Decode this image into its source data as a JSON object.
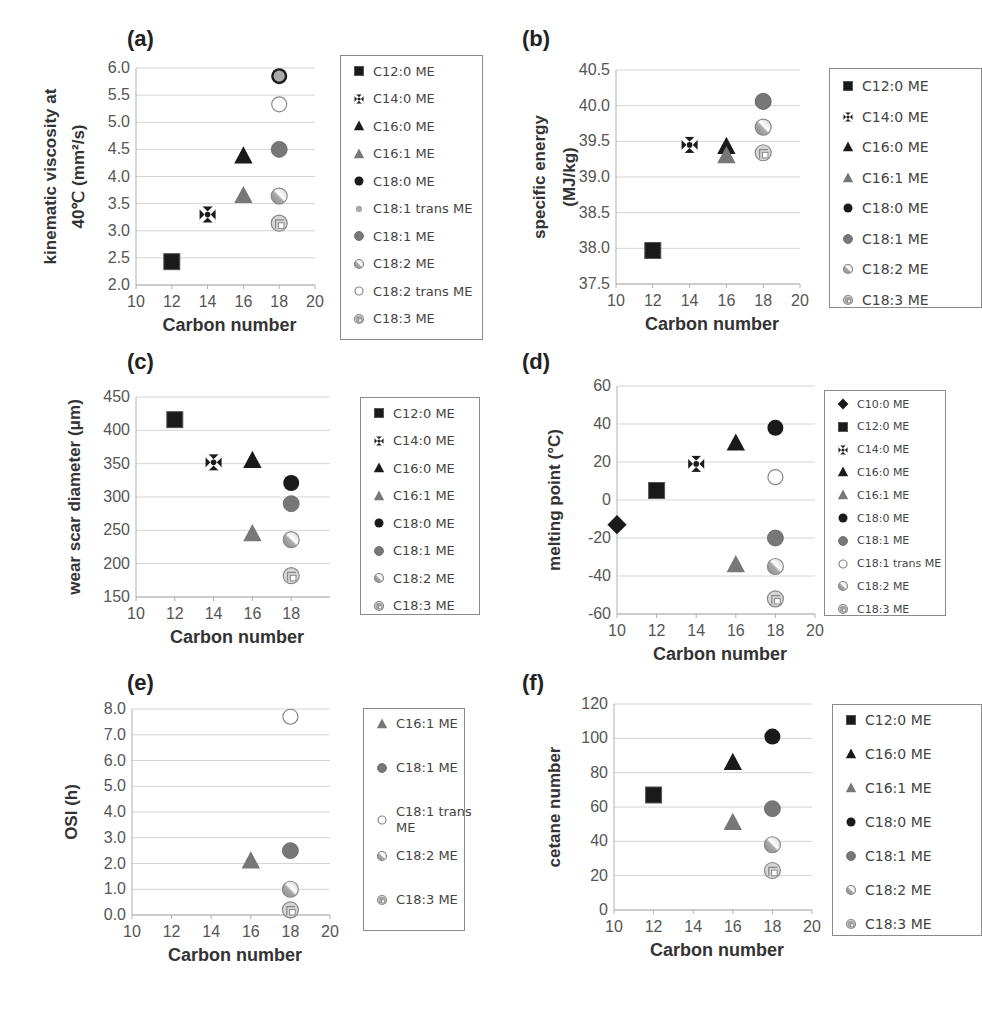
{
  "figure": {
    "panels": [
      {
        "id": "a",
        "label": "(a)"
      },
      {
        "id": "b",
        "label": "(b)"
      },
      {
        "id": "c",
        "label": "(c)"
      },
      {
        "id": "d",
        "label": "(d)"
      },
      {
        "id": "e",
        "label": "(e)"
      },
      {
        "id": "f",
        "label": "(f)"
      }
    ]
  },
  "chart_data": [
    {
      "id": "a",
      "type": "scatter",
      "panel_label": "(a)",
      "title": "",
      "xlabel": "Carbon number",
      "ylabel": "kinematic viscosity at 40°C (mm²/s)",
      "ylabel_lines": [
        "kinematic viscosity at",
        "40℃ (mm²/s)"
      ],
      "xlim": [
        10,
        20
      ],
      "xticks": [
        10,
        12,
        14,
        16,
        18,
        20
      ],
      "ylim": [
        2.0,
        6.0
      ],
      "yticks": [
        "2.0",
        "2.5",
        "3.0",
        "3.5",
        "4.0",
        "4.5",
        "5.0",
        "5.5",
        "6.0"
      ],
      "grid": true,
      "legend_position": "right",
      "series": [
        {
          "name": "C12:0 ME",
          "marker": "square",
          "x": 12,
          "y": 2.43
        },
        {
          "name": "C14:0 ME",
          "marker": "cross-square",
          "x": 14,
          "y": 3.3
        },
        {
          "name": "C16:0 ME",
          "marker": "triangle-dark",
          "x": 16,
          "y": 4.38
        },
        {
          "name": "C16:1 ME",
          "marker": "triangle-gray",
          "x": 16,
          "y": 3.65
        },
        {
          "name": "C18:0 ME",
          "marker": "circle-black",
          "x": 18,
          "y": 5.85
        },
        {
          "name": "C18:1 trans ME",
          "marker": "circle-lightgray",
          "x": 18,
          "y": 5.85
        },
        {
          "name": "C18:1 ME",
          "marker": "circle-gray",
          "x": 18,
          "y": 4.5
        },
        {
          "name": "C18:2 ME",
          "marker": "circle-hatched",
          "x": 18,
          "y": 3.64
        },
        {
          "name": "C18:2 trans ME",
          "marker": "circle-open",
          "x": 18,
          "y": 5.33
        },
        {
          "name": "C18:3 ME",
          "marker": "circle-pattern",
          "x": 18,
          "y": 3.14
        }
      ]
    },
    {
      "id": "b",
      "type": "scatter",
      "panel_label": "(b)",
      "title": "",
      "xlabel": "Carbon number",
      "ylabel": "specific energy (MJ/kg)",
      "ylabel_lines": [
        "specific energy",
        "(MJ/kg)"
      ],
      "xlim": [
        10,
        20
      ],
      "xticks": [
        10,
        12,
        14,
        16,
        18,
        20
      ],
      "ylim": [
        37.5,
        40.5
      ],
      "yticks": [
        "37.5",
        "38.0",
        "38.5",
        "39.0",
        "39.5",
        "40.0",
        "40.5"
      ],
      "grid": true,
      "legend_position": "right",
      "series": [
        {
          "name": "C12:0 ME",
          "marker": "square",
          "x": 12,
          "y": 37.97
        },
        {
          "name": "C14:0 ME",
          "marker": "cross-square",
          "x": 14,
          "y": 39.45
        },
        {
          "name": "C16:0 ME",
          "marker": "triangle-dark",
          "x": 16,
          "y": 39.43
        },
        {
          "name": "C16:1 ME",
          "marker": "triangle-gray",
          "x": 16,
          "y": 39.3
        },
        {
          "name": "C18:0 ME",
          "marker": "circle-black",
          "x": 18,
          "y": 40.06
        },
        {
          "name": "C18:1 ME",
          "marker": "circle-gray",
          "x": 18,
          "y": 40.06
        },
        {
          "name": "C18:2 ME",
          "marker": "circle-hatched",
          "x": 18,
          "y": 39.7
        },
        {
          "name": "C18:3 ME",
          "marker": "circle-pattern",
          "x": 18,
          "y": 39.34
        }
      ]
    },
    {
      "id": "c",
      "type": "scatter",
      "panel_label": "(c)",
      "title": "",
      "xlabel": "Carbon number",
      "ylabel": "wear scar diameter (μm)",
      "ylabel_lines": [
        "wear scar diameter (μm)"
      ],
      "xlim": [
        10,
        20
      ],
      "xticks": [
        10,
        12,
        14,
        16,
        18
      ],
      "ylim": [
        150,
        450
      ],
      "yticks": [
        "150",
        "200",
        "250",
        "300",
        "350",
        "400",
        "450"
      ],
      "grid": true,
      "legend_position": "right",
      "series": [
        {
          "name": "C12:0 ME",
          "marker": "square",
          "x": 12,
          "y": 416
        },
        {
          "name": "C14:0 ME",
          "marker": "cross-square",
          "x": 14,
          "y": 352
        },
        {
          "name": "C16:0 ME",
          "marker": "triangle-dark",
          "x": 16,
          "y": 355
        },
        {
          "name": "C16:1 ME",
          "marker": "triangle-gray",
          "x": 16,
          "y": 245
        },
        {
          "name": "C18:0 ME",
          "marker": "circle-black",
          "x": 18,
          "y": 321
        },
        {
          "name": "C18:1 ME",
          "marker": "circle-gray",
          "x": 18,
          "y": 290
        },
        {
          "name": "C18:2 ME",
          "marker": "circle-hatched",
          "x": 18,
          "y": 236
        },
        {
          "name": "C18:3 ME",
          "marker": "circle-pattern",
          "x": 18,
          "y": 182
        }
      ]
    },
    {
      "id": "d",
      "type": "scatter",
      "panel_label": "(d)",
      "title": "",
      "xlabel": "Carbon number",
      "ylabel": "melting point (°C)",
      "ylabel_lines": [
        "melting point (°C)"
      ],
      "xlim": [
        10,
        20
      ],
      "xticks": [
        10,
        12,
        14,
        16,
        18,
        20
      ],
      "ylim": [
        -60,
        60
      ],
      "yticks": [
        "-60",
        "-40",
        "-20",
        "0",
        "20",
        "40",
        "60"
      ],
      "grid": true,
      "legend_position": "right",
      "series": [
        {
          "name": "C10:0 ME",
          "marker": "diamond",
          "x": 10,
          "y": -13
        },
        {
          "name": "C12:0 ME",
          "marker": "square",
          "x": 12,
          "y": 5
        },
        {
          "name": "C14:0 ME",
          "marker": "cross-square",
          "x": 14,
          "y": 19
        },
        {
          "name": "C16:0 ME",
          "marker": "triangle-dark",
          "x": 16,
          "y": 30
        },
        {
          "name": "C16:1 ME",
          "marker": "triangle-gray",
          "x": 16,
          "y": -34
        },
        {
          "name": "C18:0 ME",
          "marker": "circle-black",
          "x": 18,
          "y": 38
        },
        {
          "name": "C18:1 ME",
          "marker": "circle-gray",
          "x": 18,
          "y": -20
        },
        {
          "name": "C18:1 trans ME",
          "marker": "circle-open",
          "x": 18,
          "y": 12
        },
        {
          "name": "C18:2 ME",
          "marker": "circle-hatched",
          "x": 18,
          "y": -35
        },
        {
          "name": "C18:3 ME",
          "marker": "circle-pattern",
          "x": 18,
          "y": -52
        }
      ]
    },
    {
      "id": "e",
      "type": "scatter",
      "panel_label": "(e)",
      "title": "",
      "xlabel": "Carbon number",
      "ylabel": "OSI (h)",
      "ylabel_lines": [
        "OSI (h)"
      ],
      "xlim": [
        10,
        20
      ],
      "xticks": [
        10,
        12,
        14,
        16,
        18,
        20
      ],
      "ylim": [
        0.0,
        8.0
      ],
      "yticks": [
        "0.0",
        "1.0",
        "2.0",
        "3.0",
        "4.0",
        "5.0",
        "6.0",
        "7.0",
        "8.0"
      ],
      "grid": true,
      "legend_position": "right",
      "series": [
        {
          "name": "C16:1 ME",
          "marker": "triangle-gray",
          "x": 16,
          "y": 2.1
        },
        {
          "name": "C18:1 ME",
          "marker": "circle-gray",
          "x": 18,
          "y": 2.5
        },
        {
          "name": "C18:1 trans ME",
          "marker": "circle-open",
          "x": 18,
          "y": 7.7
        },
        {
          "name": "C18:2 ME",
          "marker": "circle-hatched",
          "x": 18,
          "y": 1.0
        },
        {
          "name": "C18:3 ME",
          "marker": "circle-pattern",
          "x": 18,
          "y": 0.2
        }
      ]
    },
    {
      "id": "f",
      "type": "scatter",
      "panel_label": "(f)",
      "title": "",
      "xlabel": "Carbon number",
      "ylabel": "cetane number",
      "ylabel_lines": [
        "cetane number"
      ],
      "xlim": [
        10,
        20
      ],
      "xticks": [
        10,
        12,
        14,
        16,
        18,
        20
      ],
      "ylim": [
        0,
        120
      ],
      "yticks": [
        "0",
        "20",
        "40",
        "60",
        "80",
        "100",
        "120"
      ],
      "grid": true,
      "legend_position": "right",
      "series": [
        {
          "name": "C12:0 ME",
          "marker": "square",
          "x": 12,
          "y": 67
        },
        {
          "name": "C16:0 ME",
          "marker": "triangle-dark",
          "x": 16,
          "y": 86
        },
        {
          "name": "C16:1 ME",
          "marker": "triangle-gray",
          "x": 16,
          "y": 51
        },
        {
          "name": "C18:0 ME",
          "marker": "circle-black",
          "x": 18,
          "y": 101
        },
        {
          "name": "C18:1 ME",
          "marker": "circle-gray",
          "x": 18,
          "y": 59
        },
        {
          "name": "C18:2 ME",
          "marker": "circle-hatched",
          "x": 18,
          "y": 38
        },
        {
          "name": "C18:3 ME",
          "marker": "circle-pattern",
          "x": 18,
          "y": 23
        }
      ]
    }
  ],
  "colors": {
    "black": "#1a1a1a",
    "dark": "#222222",
    "gray": "#777777",
    "lightgray": "#bdbdbd",
    "grid": "#d4d4d4",
    "axis": "#b0b0b0",
    "tick_text": "#555555",
    "legend_border": "#8a8a8a"
  }
}
